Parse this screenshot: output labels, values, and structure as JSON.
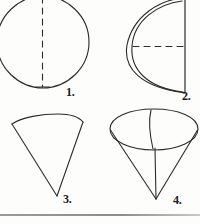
{
  "page": {
    "background_color": "#fdfdfb",
    "ink_color": "#2b2b2b",
    "width": 200,
    "height": 224
  },
  "figures": [
    {
      "number": "1.",
      "shape_name": "sphere",
      "description": "circle with vertical dashed axis through center",
      "label_text": "1."
    },
    {
      "number": "2.",
      "shape_name": "hemisphere",
      "description": "half sphere with flat vertical face on right, curved surface bulging left, horizontal dashed radius",
      "label_text": "2."
    },
    {
      "number": "3.",
      "shape_name": "cone",
      "description": "inverted cone with curved top edge and apex pointing down",
      "label_text": "3."
    },
    {
      "number": "4.",
      "shape_name": "cone-with-ellipse",
      "description": "inverted cone drawn in perspective with full elliptical top, slant line across ellipse and vertical axis to apex",
      "label_text": "4."
    }
  ],
  "divider": {
    "name": "bottom-rule",
    "color": "#9a9a9a"
  }
}
